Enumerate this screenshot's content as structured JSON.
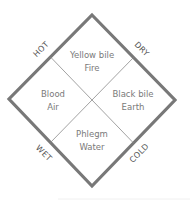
{
  "diagram": {
    "colors": {
      "border": "#787878",
      "divider": "#8a8a8a",
      "text": "#7a7a7a",
      "corner_text": "#555555"
    },
    "quadrants": {
      "top": {
        "line1": "Yellow bile",
        "line2": "Fire"
      },
      "left": {
        "line1": "Blood",
        "line2": "Air"
      },
      "right": {
        "line1": "Black bile",
        "line2": "Earth"
      },
      "bottom": {
        "line1": "Phlegm",
        "line2": "Water"
      }
    },
    "edge_labels": {
      "top_left": "HOT",
      "top_right": "DRY",
      "bottom_left": "WET",
      "bottom_right": "COLD"
    }
  }
}
